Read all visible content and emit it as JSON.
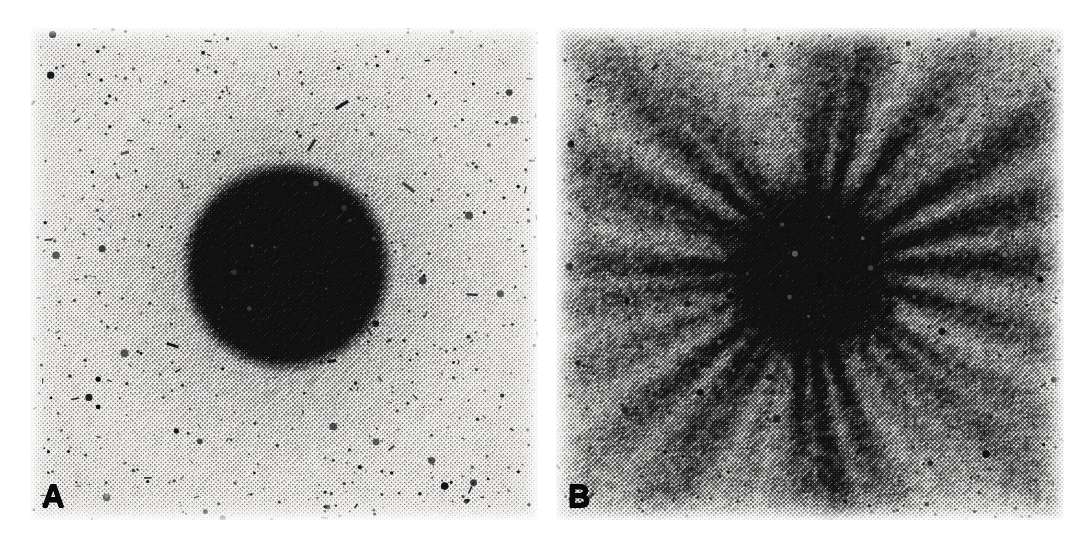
{
  "figure": {
    "type": "two-panel-micrograph",
    "background_color": "#ffffff",
    "width": 1091,
    "height": 541,
    "gap_color": "#ffffff"
  },
  "panels": [
    {
      "id": "panel-a",
      "label": "A",
      "label_position": "bottom-left",
      "label_color": "#0a0a0a",
      "frame": {
        "x": 30,
        "y": 28,
        "width": 508,
        "height": 492
      },
      "label_box": {
        "x": 42,
        "y": 481,
        "width": 34,
        "height": 36
      },
      "morphology": "compact-circular-colony",
      "render": {
        "paper_tone": "#f0efed",
        "ink_color": "#111111",
        "halftone_cell": 3.1,
        "speck_count": 900,
        "speck_max_radius": 2.6,
        "vignette": 0.1,
        "core": {
          "cx_frac": 0.505,
          "cy_frac": 0.485,
          "radius_frac": 0.175,
          "edge_softness_frac": 0.055,
          "density": 0.93
        },
        "halo": {
          "cx_frac": 0.505,
          "cy_frac": 0.485,
          "radius_frac": 0.47,
          "density": 0.4,
          "falloff": 1.55
        },
        "base_density": 0.12,
        "mottle_scale": 0.055,
        "mottle_amount": 0.07,
        "rays": {
          "count": 0,
          "amplitude": 0
        },
        "seed": 20481
      }
    },
    {
      "id": "panel-b",
      "label": "B",
      "label_position": "bottom-left",
      "label_color": "#0a0a0a",
      "frame": {
        "x": 556,
        "y": 28,
        "width": 508,
        "height": 492
      },
      "label_box": {
        "x": 568,
        "y": 481,
        "width": 34,
        "height": 36
      },
      "morphology": "radially-branching-dendritic-colony",
      "render": {
        "paper_tone": "#ececea",
        "ink_color": "#111111",
        "halftone_cell": 3.1,
        "speck_count": 1100,
        "speck_max_radius": 2.6,
        "vignette": 0.1,
        "core": {
          "cx_frac": 0.5,
          "cy_frac": 0.495,
          "radius_frac": 0.115,
          "edge_softness_frac": 0.16,
          "density": 0.95
        },
        "halo": {
          "cx_frac": 0.5,
          "cy_frac": 0.495,
          "radius_frac": 0.7,
          "density": 0.34,
          "falloff": 1.15
        },
        "base_density": 0.2,
        "mottle_scale": 0.03,
        "mottle_amount": 0.22,
        "rays": {
          "count": 26,
          "amplitude": 0.52,
          "sharpness": 5.0,
          "inner_radius_frac": 0.09,
          "outer_radius_frac": 0.78,
          "branch_jitter": 0.34,
          "secondary_count": 46,
          "secondary_amplitude": 0.26
        },
        "seed": 77113
      }
    }
  ]
}
